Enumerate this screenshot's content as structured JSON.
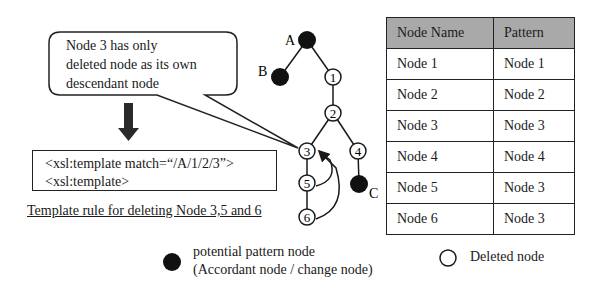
{
  "callout": {
    "lines": [
      "Node 3 has only",
      "deleted node as its own",
      "descendant node"
    ]
  },
  "template_box": {
    "lines": [
      "<xsl:template match=“/A/1/2/3”>",
      "<xsl:template>"
    ],
    "caption": "Template rule for deleting Node 3,5 and 6"
  },
  "tree": {
    "nodes": [
      {
        "id": "A",
        "label": "A",
        "type": "filled"
      },
      {
        "id": "B",
        "label": "B",
        "type": "filled"
      },
      {
        "id": "1",
        "label": "1",
        "type": "hollow"
      },
      {
        "id": "2",
        "label": "2",
        "type": "hollow"
      },
      {
        "id": "3",
        "label": "3",
        "type": "hollow"
      },
      {
        "id": "4",
        "label": "4",
        "type": "hollow"
      },
      {
        "id": "5",
        "label": "5",
        "type": "hollow"
      },
      {
        "id": "6",
        "label": "6",
        "type": "hollow"
      },
      {
        "id": "C",
        "label": "C",
        "type": "filled"
      }
    ],
    "edges": [
      [
        "A",
        "B"
      ],
      [
        "A",
        "1"
      ],
      [
        "1",
        "2"
      ],
      [
        "2",
        "3"
      ],
      [
        "2",
        "4"
      ],
      [
        "3",
        "5"
      ],
      [
        "5",
        "6"
      ],
      [
        "4",
        "C"
      ]
    ],
    "back_arrows": [
      [
        "5",
        "3"
      ],
      [
        "6",
        "3"
      ]
    ]
  },
  "table": {
    "headers": [
      "Node Name",
      "Pattern"
    ],
    "rows": [
      [
        "Node 1",
        "Node 1"
      ],
      [
        "Node 2",
        "Node 2"
      ],
      [
        "Node 3",
        "Node 3"
      ],
      [
        "Node 4",
        "Node 4"
      ],
      [
        "Node 5",
        "Node 3"
      ],
      [
        "Node 6",
        "Node 3"
      ]
    ],
    "header_bg": "#a9a9a9"
  },
  "legend": {
    "filled": {
      "line1": "potential  pattern node",
      "line2": "(Accordant node / change node)"
    },
    "hollow": {
      "label": "Deleted node"
    }
  }
}
